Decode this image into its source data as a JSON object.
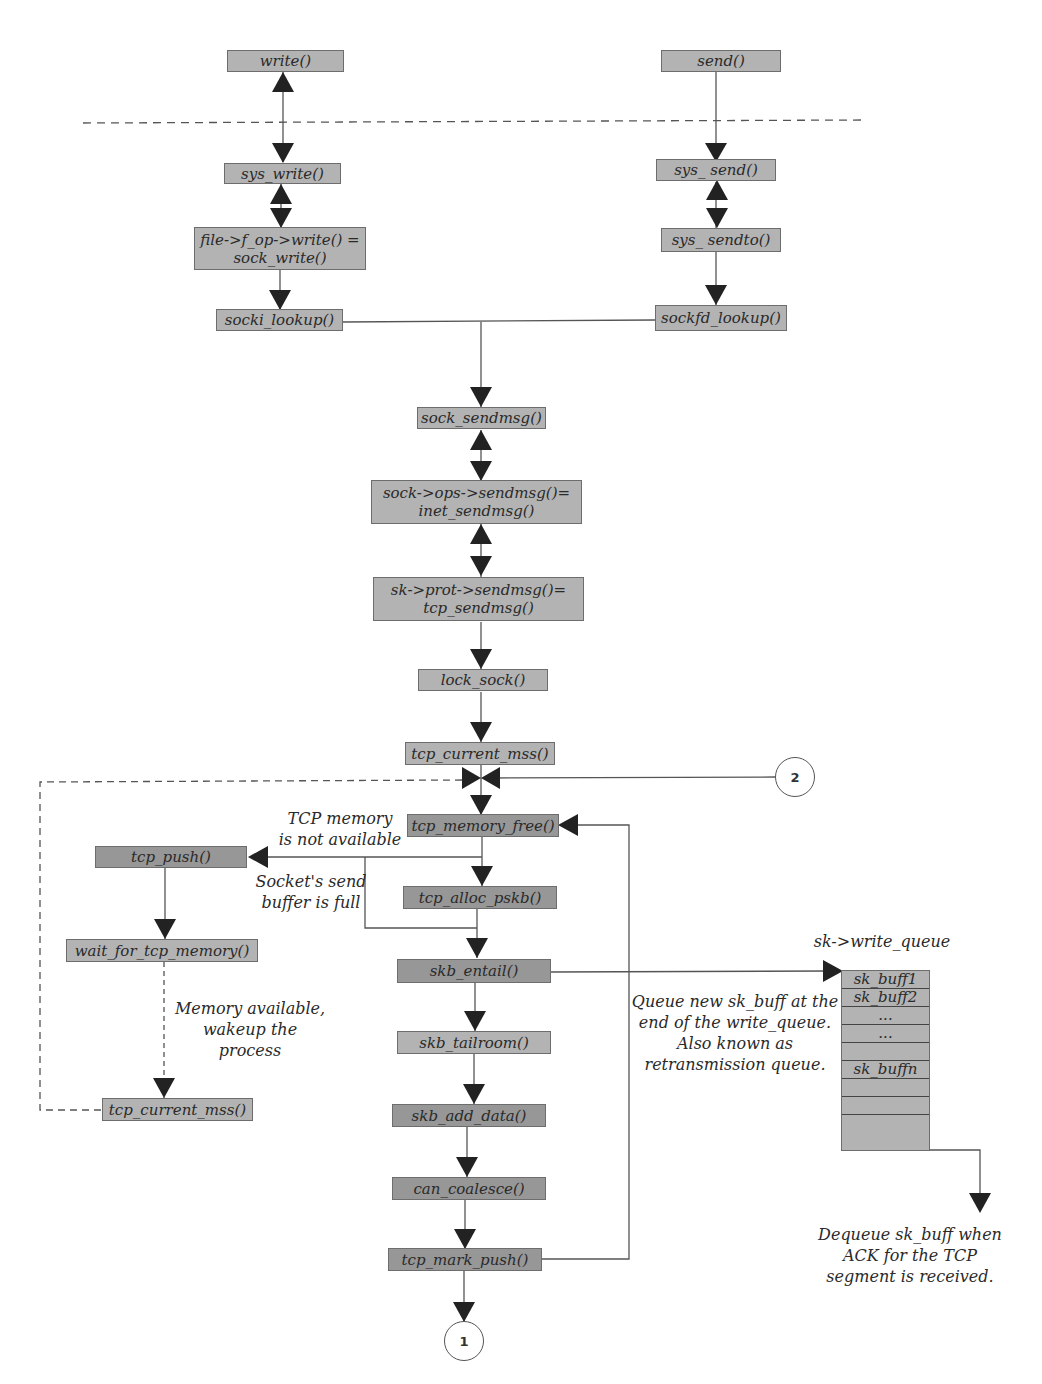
{
  "diagram": {
    "boxes": {
      "write": "write()",
      "send": "send()",
      "sys_write": "sys_write()",
      "sys_send": "sys_ send()",
      "file_write": "file->f_op->write() =\nsock_write()",
      "sys_sendto": "sys_ sendto()",
      "socki_lookup": "socki_lookup()",
      "sockfd_lookup": "sockfd_lookup()",
      "sock_sendmsg": "sock_sendmsg()",
      "inet_sendmsg": "sock->ops->sendmsg()=\ninet_sendmsg()",
      "tcp_sendmsg": "sk->prot->sendmsg()=\ntcp_sendmsg()",
      "lock_sock": "lock_sock()",
      "tcp_current_mss": "tcp_current_mss()",
      "tcp_memory_free": "tcp_memory_free()",
      "tcp_push": "tcp_push()",
      "tcp_alloc_pskb": "tcp_alloc_pskb()",
      "wait_for_tcp_memory": "wait_for_tcp_memory()",
      "skb_entail": "skb_entail()",
      "skb_tailroom": "skb_tailroom()",
      "tcp_current_mss_2": "tcp_current_mss()",
      "skb_add_data": "skb_add_data()",
      "can_coalesce": "can_coalesce()",
      "tcp_mark_push": "tcp_mark_push()"
    },
    "labels": {
      "tcp_memory_not_available": "TCP memory\nis not available",
      "socket_buffer_full": "Socket's send\nbuffer is full",
      "memory_available": "Memory available,\nwakeup the process",
      "write_queue_title": "sk->write_queue",
      "queue_note": "Queue new sk_buff at the\nend of the write_queue.\nAlso known as\nretransmission queue.",
      "dequeue_note": "Dequeue sk_buff when\nACK for the TCP\nsegment is received."
    },
    "connectors": {
      "one": "1",
      "two": "2"
    },
    "write_queue": {
      "rows": [
        "sk_buff1",
        "sk_buff2",
        "...",
        "...",
        "",
        "sk_buffn",
        "",
        "",
        ""
      ]
    },
    "colors": {
      "box_fill": "#b3b3b3",
      "box_fill_dark": "#979797",
      "line": "#555555",
      "arrow": "#222222"
    }
  }
}
